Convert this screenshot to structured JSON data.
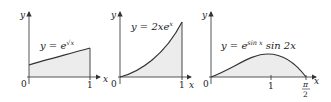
{
  "colors": {
    "fill": "#ececec",
    "curve": "#333333",
    "axis": "#444444",
    "text": "#222222"
  },
  "panels": [
    {
      "id": "panel-1",
      "equation": {
        "lhs": "y = e",
        "exp": "√x"
      },
      "y_label": "y",
      "x_label": "x",
      "origin_label": "0",
      "ticks": [
        {
          "label": "1"
        }
      ],
      "curve": "y = e^{√x}",
      "domain": [
        0,
        1
      ]
    },
    {
      "id": "panel-2",
      "equation": {
        "lhs": "y = 2xe",
        "exp": "x"
      },
      "y_label": "y",
      "x_label": "x",
      "origin_label": "0",
      "ticks": [
        {
          "label": "1"
        }
      ],
      "curve": "y = 2xe^x",
      "domain": [
        0,
        1
      ]
    },
    {
      "id": "panel-3",
      "equation": {
        "lhs": "y = e",
        "exp": "sin x",
        "rhs": " sin 2x"
      },
      "y_label": "y",
      "x_label": "x",
      "origin_label": "0",
      "ticks": [
        {
          "label": "1"
        },
        {
          "label_num": "π",
          "label_den": "2"
        }
      ],
      "curve": "y = e^{sin x} sin 2x",
      "domain": [
        0,
        1.5708
      ]
    }
  ]
}
